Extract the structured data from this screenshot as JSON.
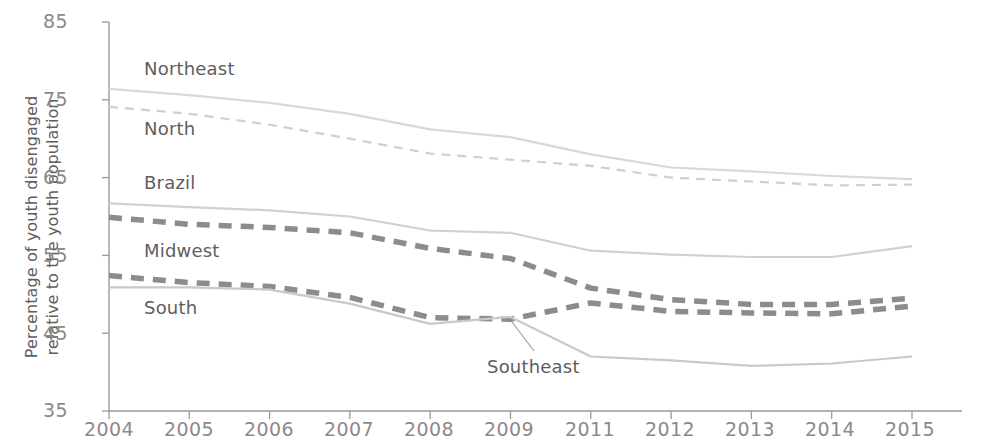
{
  "chart_data": {
    "type": "line",
    "title": "",
    "xlabel": "",
    "ylabel": "Percentage of youth disengaged\nrelative to the youth population",
    "categories": [
      "2004",
      "2005",
      "2006",
      "2007",
      "2008",
      "2009",
      "2011",
      "2012",
      "2013",
      "2014",
      "2015"
    ],
    "ylim": [
      35,
      85
    ],
    "yticks": [
      35,
      45,
      55,
      65,
      75,
      85
    ],
    "grid": false,
    "legend_position": "inline-labels",
    "series": [
      {
        "name": "Northeast",
        "style": "solid-light",
        "color": "#d8d8d8",
        "values": [
          76.4,
          75.6,
          74.6,
          73.2,
          71.2,
          70.2,
          68.0,
          66.3,
          65.8,
          65.2,
          64.8
        ]
      },
      {
        "name": "North",
        "style": "dashed-light",
        "color": "#cfcfcf",
        "values": [
          74.1,
          73.2,
          71.8,
          70.0,
          68.1,
          67.3,
          66.5,
          65.0,
          64.5,
          64.0,
          64.1
        ]
      },
      {
        "name": "Brazil",
        "style": "solid-light",
        "color": "#d0d0d0",
        "values": [
          61.7,
          61.2,
          60.8,
          60.0,
          58.2,
          57.9,
          55.6,
          55.1,
          54.8,
          54.8,
          56.2
        ]
      },
      {
        "name": "Midwest",
        "style": "dashed-dark",
        "color": "#8c8c8c",
        "values": [
          59.9,
          59.0,
          58.6,
          57.9,
          55.9,
          54.6,
          50.8,
          49.3,
          48.7,
          48.7,
          49.5
        ]
      },
      {
        "name": "South",
        "style": "dashed-dark",
        "color": "#8c8c8c",
        "values": [
          52.4,
          51.5,
          51.0,
          49.6,
          47.0,
          46.8,
          48.9,
          47.8,
          47.6,
          47.5,
          48.5
        ]
      },
      {
        "name": "Southeast",
        "style": "solid-light",
        "color": "#c9c9c9",
        "values": [
          50.9,
          50.9,
          50.6,
          48.8,
          46.2,
          47.1,
          42.0,
          41.5,
          40.8,
          41.1,
          42.0
        ]
      }
    ]
  },
  "axis": {
    "y_ticks": [
      "85",
      "75",
      "65",
      "55",
      "45",
      "35"
    ],
    "x_ticks": [
      "2004",
      "2005",
      "2006",
      "2007",
      "2008",
      "2009",
      "2011",
      "2012",
      "2013",
      "2014",
      "2015"
    ],
    "y_title_line1": "Percentage of youth disengaged",
    "y_title_line2": "relative to the youth population"
  },
  "labels": {
    "northeast": "Northeast",
    "north": "North",
    "brazil": "Brazil",
    "midwest": "Midwest",
    "south": "South",
    "southeast": "Southeast"
  },
  "colors": {
    "light_line": "#d4d4d4",
    "dark_line": "#8c8c8c",
    "axis": "#9a9a9a",
    "text": "#5e5e5e"
  }
}
